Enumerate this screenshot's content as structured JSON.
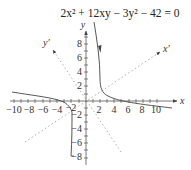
{
  "title": {
    "equation": "2x² + 12xy − 3y² − 42 = 0"
  },
  "axes": {
    "x_label": "x",
    "y_label": "y",
    "x_prime_label": "x′",
    "y_prime_label": "y′",
    "x_ticks": [
      "−10",
      "−8",
      "−6",
      "−4",
      "−2",
      "2",
      "4",
      "6",
      "8",
      "10"
    ],
    "y_ticks": [
      "8",
      "6",
      "4",
      "2",
      "−2",
      "−4",
      "−6",
      "−8"
    ]
  },
  "colors": {
    "axis": "#555555",
    "curve": "#444444",
    "rotated_axis": "#888888"
  }
}
